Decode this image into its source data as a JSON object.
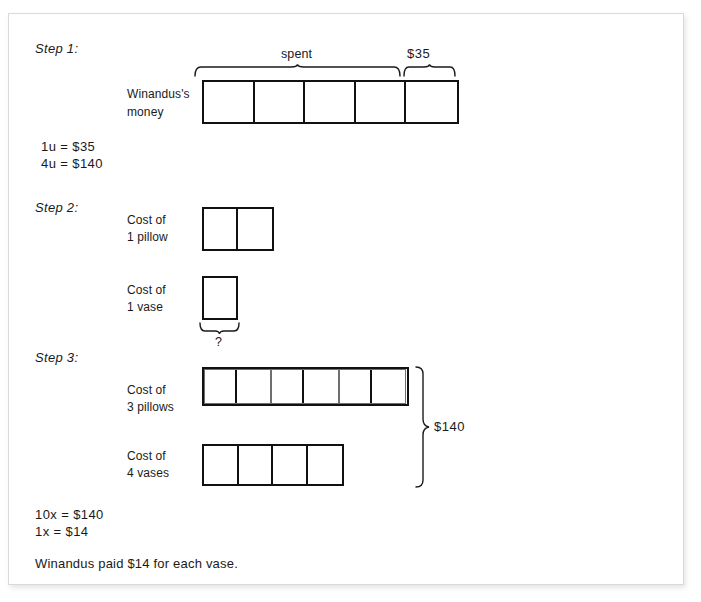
{
  "worksheet": {
    "steps": [
      {
        "label": "Step 1:",
        "row_label_line1": "Winandus's",
        "row_label_line2": "money",
        "brace_spent": "spent",
        "brace_amount": "$35",
        "bar_cells": 5,
        "spent_cells": 4,
        "amount_cells": 1
      },
      {
        "label": "Step 2:",
        "pillow_label_line1": "Cost of",
        "pillow_label_line2": "1 pillow",
        "vase_label_line1": "Cost of",
        "vase_label_line2": "1 vase",
        "pillow_cells": 2,
        "vase_cells": 1,
        "question_mark": "?"
      },
      {
        "label": "Step 3:",
        "pillows_label_line1": "Cost of",
        "pillows_label_line2": "3 pillows",
        "vases_label_line1": "Cost of",
        "vases_label_line2": "4 vases",
        "pillow_groups": 3,
        "cells_per_group": 2,
        "vase_cells": 4,
        "total_label": "$140"
      }
    ],
    "equations_top": {
      "line1": "1u = $35",
      "line2": "4u = $140"
    },
    "equations_bottom": {
      "line1": "10x = $140",
      "line2": "1x = $14"
    },
    "conclusion": "Winandus paid $14 for each vase."
  },
  "colors": {
    "ink": "#1a1a1a",
    "bar_stroke": "#111111",
    "group_stroke": "#6f6f6f",
    "paper": "#ffffff",
    "page_border": "#d9d9d9"
  }
}
